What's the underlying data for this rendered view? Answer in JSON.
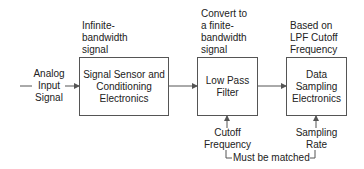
{
  "diagram": {
    "input": {
      "label": "Analog\nInput\nSignal"
    },
    "blocks": [
      {
        "label": "Signal Sensor and\nConditioning\nElectronics",
        "annotation": "Infinite-\nbandwidth\nsignal"
      },
      {
        "label": "Low Pass\nFilter",
        "annotation": "Convert to\na finite-\nbandwidth\nsignal",
        "control": "Cutoff\nFrequency"
      },
      {
        "label": "Data\nSampling\nElectronics",
        "annotation": "Based on\nLPF Cutoff\nFrequency",
        "control": "Sampling\nRate"
      }
    ],
    "match_note": "Must be matched"
  },
  "colors": {
    "line": "#555555",
    "text": "#222222"
  }
}
